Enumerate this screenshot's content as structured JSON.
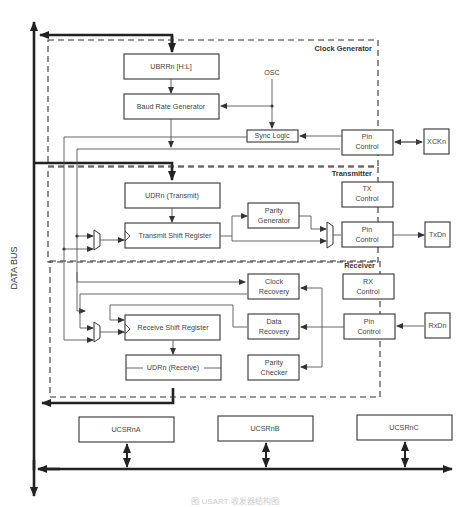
{
  "diagram": {
    "bus_label": "DATA BUS",
    "sections": {
      "clock_generator": "Clock Generator",
      "transmitter": "Transmitter",
      "receiver": "Receiver"
    },
    "blocks": {
      "ubrr": "UBRRn [H:L]",
      "baud": "Baud Rate Generator",
      "osc": "OSC",
      "sync": "Sync Logic",
      "clk_pin_1": "Pin",
      "clk_pin_2": "Control",
      "xck": "XCKn",
      "udr_tx": "UDRn (Transmit)",
      "tx_ctrl_1": "TX",
      "tx_ctrl_2": "Control",
      "parity_gen_1": "Parity",
      "parity_gen_2": "Generator",
      "tx_shift": "Transmit Shift Register",
      "tx_pin_1": "Pin",
      "tx_pin_2": "Control",
      "txd": "TxDn",
      "clk_rec_1": "Clock",
      "clk_rec_2": "Recovery",
      "rx_ctrl_1": "RX",
      "rx_ctrl_2": "Control",
      "rx_shift": "Receive Shift Register",
      "data_rec_1": "Data",
      "data_rec_2": "Recovery",
      "rx_pin_1": "Pin",
      "rx_pin_2": "Control",
      "rxd": "RxDn",
      "udr_rx": "UDRn (Receive)",
      "parity_chk_1": "Parity",
      "parity_chk_2": "Checker",
      "ucsra": "UCSRnA",
      "ucsrb": "UCSRnB",
      "ucsrc": "UCSRnC"
    },
    "caption": "图 USART 收发器结构图"
  }
}
